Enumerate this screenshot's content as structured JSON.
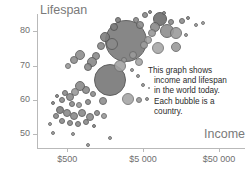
{
  "chart_data": {
    "type": "scatter",
    "title": "",
    "xlabel": "Income",
    "ylabel": "Lifespan",
    "xscale": "log",
    "xlim": [
      200,
      110000
    ],
    "ylim": [
      46,
      85
    ],
    "grid": false,
    "legend": "none",
    "xticks": [
      {
        "value": 500,
        "label": "$500"
      },
      {
        "value": 5000,
        "label": "$5 000"
      },
      {
        "value": 50000,
        "label": "$50 000"
      }
    ],
    "yticks": [
      {
        "value": 50,
        "label": "50"
      },
      {
        "value": 60,
        "label": "60"
      },
      {
        "value": 70,
        "label": "70"
      },
      {
        "value": 80,
        "label": "80"
      }
    ],
    "annotation": {
      "lines": [
        "This graph shows",
        "income and lifespan",
        "in the world today.",
        "Each bubble is a",
        "country."
      ]
    },
    "bubble_fill": "#8a8a8a",
    "bubble_stroke": "#5a5a5a",
    "axis_color": "#b9b9b9",
    "label_color": "#6f6f6f",
    "title_color": "#7a7a7a",
    "bubbles": [
      {
        "x": 126,
        "y": 41,
        "r": 21,
        "fill": "#7d7d7d",
        "stroke": "#565656",
        "alpha": 0.92
      },
      {
        "x": 110,
        "y": 80,
        "r": 16,
        "fill": "#7a7a7a",
        "stroke": "#545454",
        "alpha": 0.92
      },
      {
        "x": 160,
        "y": 19,
        "r": 7,
        "fill": "#6e6e6e",
        "stroke": "#4d4d4d",
        "alpha": 0.9
      },
      {
        "x": 167,
        "y": 31,
        "r": 7,
        "fill": "#8e8e8e",
        "stroke": "#5f5f5f",
        "alpha": 0.9
      },
      {
        "x": 176,
        "y": 33,
        "r": 6,
        "fill": "#9c9c9c",
        "stroke": "#6a6a6a",
        "alpha": 0.9
      },
      {
        "x": 155,
        "y": 27,
        "r": 5,
        "fill": "#8a8a8a",
        "stroke": "#5c5c5c",
        "alpha": 0.9
      },
      {
        "x": 152,
        "y": 33,
        "r": 4,
        "fill": "#9a9a9a",
        "stroke": "#6b6b6b",
        "alpha": 0.9
      },
      {
        "x": 148,
        "y": 40,
        "r": 4,
        "fill": "#a2a2a2",
        "stroke": "#727272",
        "alpha": 0.9
      },
      {
        "x": 144,
        "y": 45,
        "r": 4,
        "fill": "#9e9e9e",
        "stroke": "#6e6e6e",
        "alpha": 0.9
      },
      {
        "x": 158,
        "y": 48,
        "r": 6,
        "fill": "#a8a8a8",
        "stroke": "#757575",
        "alpha": 0.9
      },
      {
        "x": 176,
        "y": 47,
        "r": 5,
        "fill": "#9b9b9b",
        "stroke": "#6c6c6c",
        "alpha": 0.9
      },
      {
        "x": 182,
        "y": 21,
        "r": 3,
        "fill": "#8d8d8d",
        "stroke": "#5f5f5f",
        "alpha": 0.9
      },
      {
        "x": 188,
        "y": 18,
        "r": 2,
        "fill": "#8d8d8d",
        "stroke": "#5f5f5f",
        "alpha": 0.9
      },
      {
        "x": 196,
        "y": 25,
        "r": 2,
        "fill": "#9b9b9b",
        "stroke": "#6c6c6c",
        "alpha": 0.9
      },
      {
        "x": 203,
        "y": 23,
        "r": 2,
        "fill": "#a0a0a0",
        "stroke": "#707070",
        "alpha": 0.9
      },
      {
        "x": 140,
        "y": 25,
        "r": 4,
        "fill": "#8a8a8a",
        "stroke": "#5c5c5c",
        "alpha": 0.9
      },
      {
        "x": 136,
        "y": 20,
        "r": 3,
        "fill": "#8a8a8a",
        "stroke": "#5c5c5c",
        "alpha": 0.9
      },
      {
        "x": 133,
        "y": 55,
        "r": 4,
        "fill": "#9a9a9a",
        "stroke": "#6b6b6b",
        "alpha": 0.9
      },
      {
        "x": 124,
        "y": 60,
        "r": 3,
        "fill": "#9a9a9a",
        "stroke": "#6b6b6b",
        "alpha": 0.9
      },
      {
        "x": 139,
        "y": 62,
        "r": 4,
        "fill": "#a4a4a4",
        "stroke": "#747474",
        "alpha": 0.9
      },
      {
        "x": 112,
        "y": 44,
        "r": 6,
        "fill": "#8a8a8a",
        "stroke": "#5c5c5c",
        "alpha": 0.9
      },
      {
        "x": 105,
        "y": 37,
        "r": 5,
        "fill": "#7e7e7e",
        "stroke": "#565656",
        "alpha": 0.9
      },
      {
        "x": 101,
        "y": 46,
        "r": 4,
        "fill": "#8a8a8a",
        "stroke": "#5c5c5c",
        "alpha": 0.9
      },
      {
        "x": 96,
        "y": 56,
        "r": 4,
        "fill": "#8a8a8a",
        "stroke": "#5c5c5c",
        "alpha": 0.9
      },
      {
        "x": 92,
        "y": 62,
        "r": 5,
        "fill": "#8a8a8a",
        "stroke": "#5c5c5c",
        "alpha": 0.9
      },
      {
        "x": 88,
        "y": 67,
        "r": 4,
        "fill": "#8a8a8a",
        "stroke": "#5c5c5c",
        "alpha": 0.9
      },
      {
        "x": 80,
        "y": 55,
        "r": 5,
        "fill": "#8f8f8f",
        "stroke": "#616161",
        "alpha": 0.9
      },
      {
        "x": 74,
        "y": 60,
        "r": 4,
        "fill": "#8f8f8f",
        "stroke": "#616161",
        "alpha": 0.9
      },
      {
        "x": 68,
        "y": 66,
        "r": 3,
        "fill": "#9a9a9a",
        "stroke": "#6b6b6b",
        "alpha": 0.9
      },
      {
        "x": 120,
        "y": 66,
        "r": 6,
        "fill": "#a2a2a2",
        "stroke": "#727272",
        "alpha": 0.9
      },
      {
        "x": 128,
        "y": 99,
        "r": 6,
        "fill": "#a6a6a6",
        "stroke": "#767676",
        "alpha": 0.9
      },
      {
        "x": 139,
        "y": 100,
        "r": 3,
        "fill": "#9a9a9a",
        "stroke": "#6b6b6b",
        "alpha": 0.9
      },
      {
        "x": 147,
        "y": 99,
        "r": 2,
        "fill": "#9a9a9a",
        "stroke": "#6b6b6b",
        "alpha": 0.9
      },
      {
        "x": 103,
        "y": 101,
        "r": 4,
        "fill": "#8f8f8f",
        "stroke": "#616161",
        "alpha": 0.9
      },
      {
        "x": 93,
        "y": 94,
        "r": 3,
        "fill": "#8f8f8f",
        "stroke": "#616161",
        "alpha": 0.9
      },
      {
        "x": 86,
        "y": 90,
        "r": 4,
        "fill": "#8a8a8a",
        "stroke": "#5c5c5c",
        "alpha": 0.9
      },
      {
        "x": 80,
        "y": 86,
        "r": 5,
        "fill": "#8a8a8a",
        "stroke": "#5c5c5c",
        "alpha": 0.9
      },
      {
        "x": 75,
        "y": 92,
        "r": 4,
        "fill": "#9a9a9a",
        "stroke": "#6b6b6b",
        "alpha": 0.9
      },
      {
        "x": 70,
        "y": 97,
        "r": 4,
        "fill": "#8a8a8a",
        "stroke": "#5c5c5c",
        "alpha": 0.9
      },
      {
        "x": 65,
        "y": 93,
        "r": 3,
        "fill": "#8a8a8a",
        "stroke": "#5c5c5c",
        "alpha": 0.9
      },
      {
        "x": 62,
        "y": 100,
        "r": 3,
        "fill": "#8a8a8a",
        "stroke": "#5c5c5c",
        "alpha": 0.9
      },
      {
        "x": 72,
        "y": 104,
        "r": 3,
        "fill": "#8a8a8a",
        "stroke": "#5c5c5c",
        "alpha": 0.9
      },
      {
        "x": 79,
        "y": 105,
        "r": 3,
        "fill": "#9a9a9a",
        "stroke": "#6b6b6b",
        "alpha": 0.9
      },
      {
        "x": 88,
        "y": 102,
        "r": 3,
        "fill": "#8a8a8a",
        "stroke": "#5c5c5c",
        "alpha": 0.9
      },
      {
        "x": 57,
        "y": 96,
        "r": 2,
        "fill": "#8a8a8a",
        "stroke": "#5c5c5c",
        "alpha": 0.9
      },
      {
        "x": 53,
        "y": 103,
        "r": 2,
        "fill": "#8a8a8a",
        "stroke": "#5c5c5c",
        "alpha": 0.9
      },
      {
        "x": 60,
        "y": 110,
        "r": 4,
        "fill": "#7e7e7e",
        "stroke": "#565656",
        "alpha": 0.9
      },
      {
        "x": 67,
        "y": 113,
        "r": 4,
        "fill": "#8a8a8a",
        "stroke": "#5c5c5c",
        "alpha": 0.9
      },
      {
        "x": 74,
        "y": 116,
        "r": 4,
        "fill": "#8a8a8a",
        "stroke": "#5c5c5c",
        "alpha": 0.9
      },
      {
        "x": 82,
        "y": 113,
        "r": 4,
        "fill": "#8a8a8a",
        "stroke": "#5c5c5c",
        "alpha": 0.9
      },
      {
        "x": 90,
        "y": 117,
        "r": 4,
        "fill": "#8a8a8a",
        "stroke": "#5c5c5c",
        "alpha": 0.9
      },
      {
        "x": 97,
        "y": 113,
        "r": 3,
        "fill": "#8a8a8a",
        "stroke": "#5c5c5c",
        "alpha": 0.9
      },
      {
        "x": 104,
        "y": 116,
        "r": 3,
        "fill": "#9a9a9a",
        "stroke": "#6b6b6b",
        "alpha": 0.9
      },
      {
        "x": 56,
        "y": 116,
        "r": 3,
        "fill": "#8a8a8a",
        "stroke": "#5c5c5c",
        "alpha": 0.9
      },
      {
        "x": 62,
        "y": 121,
        "r": 3,
        "fill": "#8a8a8a",
        "stroke": "#5c5c5c",
        "alpha": 0.9
      },
      {
        "x": 70,
        "y": 123,
        "r": 3,
        "fill": "#8a8a8a",
        "stroke": "#5c5c5c",
        "alpha": 0.9
      },
      {
        "x": 78,
        "y": 124,
        "r": 3,
        "fill": "#8a8a8a",
        "stroke": "#5c5c5c",
        "alpha": 0.9
      },
      {
        "x": 86,
        "y": 122,
        "r": 3,
        "fill": "#8a8a8a",
        "stroke": "#5c5c5c",
        "alpha": 0.9
      },
      {
        "x": 94,
        "y": 126,
        "r": 2,
        "fill": "#8a8a8a",
        "stroke": "#5c5c5c",
        "alpha": 0.9
      },
      {
        "x": 50,
        "y": 124,
        "r": 2,
        "fill": "#9a9a9a",
        "stroke": "#6b6b6b",
        "alpha": 0.9
      },
      {
        "x": 53,
        "y": 133,
        "r": 2,
        "fill": "#9a9a9a",
        "stroke": "#6b6b6b",
        "alpha": 0.9
      },
      {
        "x": 73,
        "y": 134,
        "r": 2,
        "fill": "#9a9a9a",
        "stroke": "#6b6b6b",
        "alpha": 0.9
      },
      {
        "x": 110,
        "y": 138,
        "r": 2,
        "fill": "#9a9a9a",
        "stroke": "#6b6b6b",
        "alpha": 0.9
      },
      {
        "x": 88,
        "y": 145,
        "r": 2,
        "fill": "#9a9a9a",
        "stroke": "#6b6b6b",
        "alpha": 0.9
      },
      {
        "x": 132,
        "y": 70,
        "r": 2,
        "fill": "#9a9a9a",
        "stroke": "#6b6b6b",
        "alpha": 0.9
      },
      {
        "x": 138,
        "y": 76,
        "r": 2,
        "fill": "#9a9a9a",
        "stroke": "#6b6b6b",
        "alpha": 0.9
      },
      {
        "x": 143,
        "y": 85,
        "r": 2,
        "fill": "#9a9a9a",
        "stroke": "#6b6b6b",
        "alpha": 0.9
      },
      {
        "x": 149,
        "y": 88,
        "r": 1,
        "fill": "#9a9a9a",
        "stroke": "#6b6b6b",
        "alpha": 0.9
      },
      {
        "x": 114,
        "y": 27,
        "r": 4,
        "fill": "#7e7e7e",
        "stroke": "#565656",
        "alpha": 0.9
      },
      {
        "x": 118,
        "y": 20,
        "r": 3,
        "fill": "#7e7e7e",
        "stroke": "#565656",
        "alpha": 0.9
      },
      {
        "x": 145,
        "y": 15,
        "r": 3,
        "fill": "#8a8a8a",
        "stroke": "#5c5c5c",
        "alpha": 0.9
      },
      {
        "x": 150,
        "y": 12,
        "r": 2,
        "fill": "#8a8a8a",
        "stroke": "#5c5c5c",
        "alpha": 0.9
      },
      {
        "x": 164,
        "y": 13,
        "r": 2,
        "fill": "#8a8a8a",
        "stroke": "#5c5c5c",
        "alpha": 0.9
      },
      {
        "x": 171,
        "y": 22,
        "r": 3,
        "fill": "#8a8a8a",
        "stroke": "#5c5c5c",
        "alpha": 0.9
      },
      {
        "x": 186,
        "y": 35,
        "r": 2,
        "fill": "#9a9a9a",
        "stroke": "#6b6b6b",
        "alpha": 0.9
      }
    ]
  }
}
